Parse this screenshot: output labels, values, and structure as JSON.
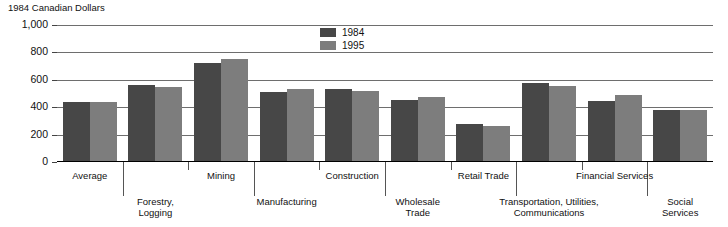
{
  "chart_data": {
    "type": "bar",
    "title": "1984 Canadian Dollars",
    "xlabel": "",
    "ylabel": "",
    "ylim": [
      0,
      1000
    ],
    "yticks": [
      "0",
      "200",
      "400",
      "600",
      "800",
      "1,000"
    ],
    "ytick_values": [
      0,
      200,
      400,
      600,
      800,
      1000
    ],
    "grid": true,
    "legend_position": "top-center",
    "categories": [
      "Average",
      "Forestry,\nLogging",
      "Mining",
      "Manufacturing",
      "Construction",
      "Wholesale\nTrade",
      "Retail Trade",
      "Transportation, Utilities,\nCommunications",
      "Financial Services",
      "Social\nServices"
    ],
    "series": [
      {
        "name": "1984",
        "color": "#474747",
        "values": [
          440,
          560,
          725,
          510,
          535,
          455,
          275,
          580,
          445,
          380
        ]
      },
      {
        "name": "1995",
        "color": "#7d7d7d",
        "values": [
          440,
          550,
          755,
          530,
          515,
          475,
          260,
          555,
          490,
          380
        ]
      }
    ]
  },
  "legend": {
    "items": [
      {
        "label": "1984"
      },
      {
        "label": "1995"
      }
    ]
  },
  "colors": {
    "series_1984": "#474747",
    "series_1995": "#7d7d7d",
    "gridline": "#6e6e6e",
    "axis": "#000000",
    "text": "#111111",
    "background": "#ffffff"
  }
}
